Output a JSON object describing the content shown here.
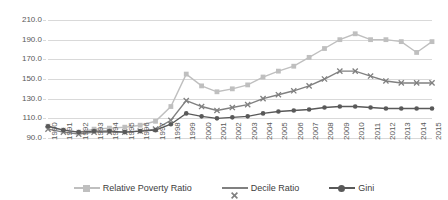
{
  "chart_data": {
    "type": "line",
    "title": "",
    "xlabel": "",
    "ylabel": "",
    "ylim": [
      90.0,
      210.0
    ],
    "ytick_step": 20,
    "ytick_labels": [
      "210.0",
      "190.0",
      "170.0",
      "150.0",
      "130.0",
      "110.0",
      "90.0"
    ],
    "ytick_values": [
      210.0,
      190.0,
      170.0,
      150.0,
      130.0,
      110.0,
      90.0
    ],
    "grid": "horizontal",
    "legend_position": "bottom",
    "categories": [
      1990,
      1991,
      1992,
      1993,
      1994,
      1995,
      1996,
      1997,
      1998,
      1999,
      2000,
      2001,
      2002,
      2003,
      2004,
      2005,
      2006,
      2007,
      2008,
      2009,
      2010,
      2011,
      2012,
      2013,
      2014,
      2015
    ],
    "xtick_labels": [
      "1990",
      "1991",
      "1992",
      "1993",
      "1994",
      "1995",
      "1996",
      "1997",
      "1998",
      "1999",
      "2000",
      "2001",
      "2002",
      "2003",
      "2004",
      "2005",
      "2006",
      "2007",
      "2008",
      "2009",
      "2010",
      "2011",
      "2012",
      "2013",
      "2014",
      "2015"
    ],
    "series": [
      {
        "name": "Relative Poverty Ratio",
        "color": "#bfbfbf",
        "marker": "square",
        "values": [
          102,
          98,
          96,
          99,
          100,
          101,
          103,
          107,
          122,
          155,
          143,
          137,
          140,
          144,
          152,
          158,
          163,
          172,
          181,
          190,
          196,
          190,
          190,
          188,
          177,
          188
        ]
      },
      {
        "name": "Decile Ratio",
        "color": "#808080",
        "marker": "x",
        "values": [
          99,
          96,
          94,
          96,
          96,
          96,
          97,
          99,
          108,
          128,
          122,
          118,
          121,
          124,
          130,
          134,
          138,
          143,
          150,
          158,
          158,
          153,
          148,
          146,
          146,
          146
        ]
      },
      {
        "name": "Gini",
        "color": "#595959",
        "marker": "circle",
        "values": [
          102,
          98,
          96,
          97,
          97,
          96,
          97,
          98,
          104,
          115,
          112,
          110,
          111,
          112,
          115,
          117,
          118,
          119,
          121,
          122,
          122,
          121,
          120,
          120,
          120,
          120
        ]
      }
    ]
  }
}
